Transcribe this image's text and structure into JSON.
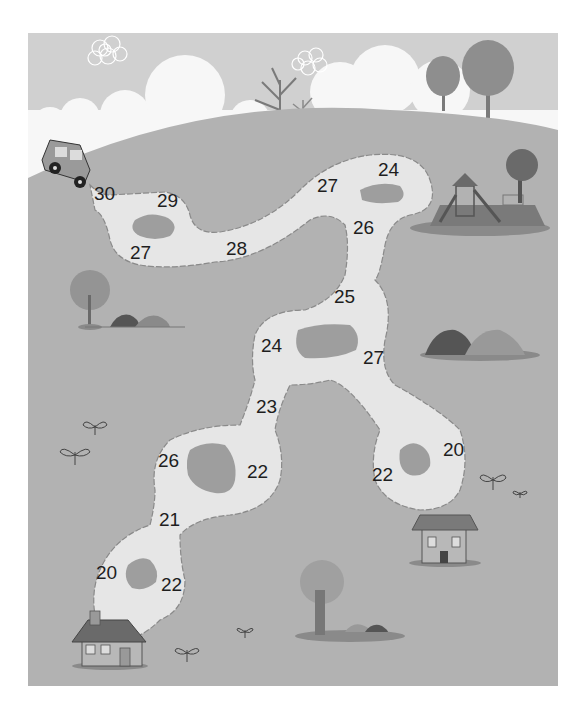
{
  "puzzle": {
    "title": "Number path maze",
    "start": {
      "label": "car",
      "value": "30"
    },
    "end_houses": [
      "house-bottom-left",
      "house-right"
    ],
    "numbers": [
      {
        "id": "n30",
        "value": "30",
        "x": 107,
        "y": 200
      },
      {
        "id": "n29",
        "value": "29",
        "x": 169,
        "y": 206
      },
      {
        "id": "n27a",
        "value": "27",
        "x": 142,
        "y": 258
      },
      {
        "id": "n28",
        "value": "28",
        "x": 237,
        "y": 254
      },
      {
        "id": "n27b",
        "value": "27",
        "x": 329,
        "y": 192
      },
      {
        "id": "n24a",
        "value": "24",
        "x": 389,
        "y": 176
      },
      {
        "id": "n26a",
        "value": "26",
        "x": 365,
        "y": 234
      },
      {
        "id": "n25",
        "value": "25",
        "x": 346,
        "y": 303
      },
      {
        "id": "n24b",
        "value": "24",
        "x": 273,
        "y": 351
      },
      {
        "id": "n27c",
        "value": "27",
        "x": 374,
        "y": 364
      },
      {
        "id": "n23",
        "value": "23",
        "x": 268,
        "y": 413
      },
      {
        "id": "n26b",
        "value": "26",
        "x": 170,
        "y": 466
      },
      {
        "id": "n22a",
        "value": "22",
        "x": 259,
        "y": 478
      },
      {
        "id": "n21",
        "value": "21",
        "x": 170,
        "y": 525
      },
      {
        "id": "n22b",
        "value": "22",
        "x": 384,
        "y": 480
      },
      {
        "id": "n20a",
        "value": "20",
        "x": 455,
        "y": 455
      },
      {
        "id": "n20b",
        "value": "20",
        "x": 108,
        "y": 578
      },
      {
        "id": "n22c",
        "value": "22",
        "x": 173,
        "y": 590
      }
    ]
  },
  "colors": {
    "sky": "#d0d0d0",
    "cloud": "#ffffff",
    "grass": "#b2b2b2",
    "path": "#e6e6e6",
    "pond": "#9e9e9e",
    "text": "#1e1e1e"
  }
}
